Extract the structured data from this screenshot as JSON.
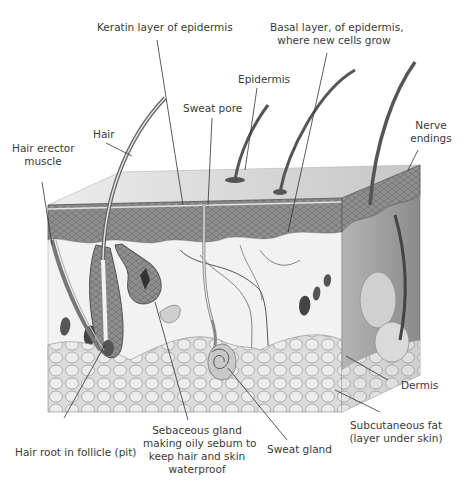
{
  "diagram": {
    "labels": {
      "keratin": "Keratin layer of epidermis",
      "basal_line1": "Basal layer, of epidermis,",
      "basal_line2": "where new cells grow",
      "epidermis": "Epidermis",
      "sweat_pore": "Sweat pore",
      "hair": "Hair",
      "hair_erector_line1": "Hair erector",
      "hair_erector_line2": "muscle",
      "nerve_line1": "Nerve",
      "nerve_line2": "endings",
      "dermis": "Dermis",
      "subcut_line1": "Subcutaneous fat",
      "subcut_line2": "(layer under skin)",
      "hair_root": "Hair root in follicle (pit)",
      "sebaceous_line1": "Sebaceous gland",
      "sebaceous_line2": "making oily sebum to",
      "sebaceous_line3": "keep hair and skin",
      "sebaceous_line4": "waterproof",
      "sweat_gland": "Sweat gland"
    },
    "colors": {
      "background": "#ffffff",
      "label_text": "#3a3a3a",
      "leader_line": "#333333",
      "top_surface": "#d9d9d9",
      "epidermis_band": "#8c8c8c",
      "dermis": "#efefef",
      "fat": "#d4d4d4",
      "side_face": "#a9a9a9"
    }
  }
}
